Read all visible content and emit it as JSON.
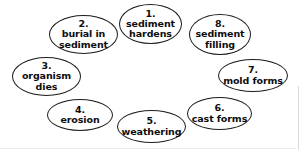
{
  "diagram": {
    "type": "cycle-diagram",
    "background_color": "#ffffff",
    "node_border_color": "#1c1c1c",
    "text_color": "#0d0d0d",
    "nodes": [
      {
        "number": "1.",
        "label": "sediment hardens",
        "line1": "sediment",
        "line2": "hardens"
      },
      {
        "number": "2.",
        "label": "burial in sediment",
        "line1": "burial in",
        "line2": "sediment"
      },
      {
        "number": "3.",
        "label": "organism dies",
        "line1": "organism",
        "line2": "dies"
      },
      {
        "number": "4.",
        "label": "erosion",
        "line1": "erosion",
        "line2": ""
      },
      {
        "number": "5.",
        "label": "weathering",
        "line1": "weathering",
        "line2": ""
      },
      {
        "number": "6.",
        "label": "cast forms",
        "line1": "cast forms",
        "line2": ""
      },
      {
        "number": "7.",
        "label": "mold forms",
        "line1": "mold forms",
        "line2": ""
      },
      {
        "number": "8.",
        "label": "sediment filling",
        "line1": "sediment",
        "line2": "filling"
      }
    ]
  }
}
